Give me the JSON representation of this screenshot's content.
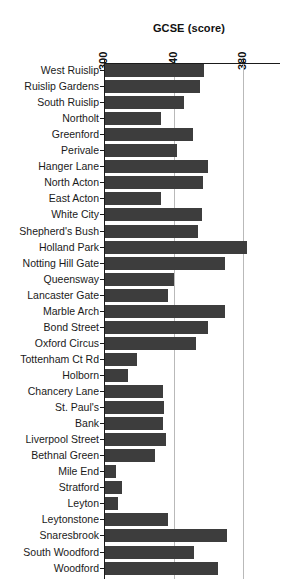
{
  "chart": {
    "title": "GCSE (score)",
    "axis_ticks": [
      "300",
      "340",
      "380"
    ]
  },
  "chart_data": {
    "type": "bar",
    "orientation": "horizontal",
    "title": "GCSE (score)",
    "xlabel": "GCSE (score)",
    "ylabel": "",
    "xlim": [
      300,
      386
    ],
    "xticks": [
      300,
      340,
      380
    ],
    "grid": true,
    "legend": null,
    "bar_color": "#3d3d3d",
    "categories": [
      "West Ruislip",
      "Ruislip Gardens",
      "South Ruislip",
      "Northolt",
      "Greenford",
      "Perivale",
      "Hanger Lane",
      "North Acton",
      "East Acton",
      "White City",
      "Shepherd's Bush",
      "Holland Park",
      "Notting Hill Gate",
      "Queensway",
      "Lancaster Gate",
      "Marble Arch",
      "Bond Street",
      "Oxford Circus",
      "Tottenham Ct Rd",
      "Holborn",
      "Chancery Lane",
      "St. Paul's",
      "Bank",
      "Liverpool Street",
      "Bethnal Green",
      "Mile End",
      "Stratford",
      "Leyton",
      "Leytonstone",
      "Snaresbrook",
      "South Woodford",
      "Woodford"
    ],
    "values": [
      357.0,
      354.5,
      345.5,
      332.5,
      350.5,
      341.5,
      359.5,
      356.5,
      332.0,
      356.0,
      353.5,
      382.0,
      369.0,
      339.5,
      336.5,
      369.0,
      359.5,
      352.5,
      318.5,
      313.0,
      333.5,
      334.0,
      333.5,
      335.0,
      328.5,
      306.5,
      310.0,
      307.5,
      336.0,
      370.0,
      351.5,
      365.0
    ]
  }
}
